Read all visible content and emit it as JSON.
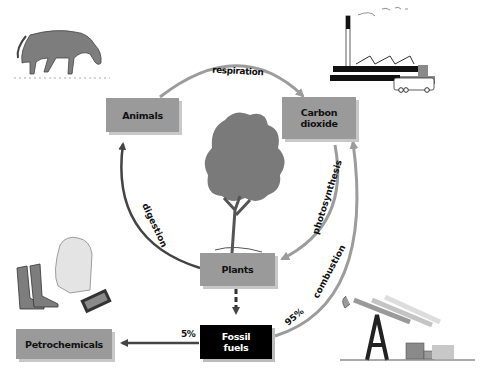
{
  "diagram": {
    "type": "carbon-cycle",
    "nodes": {
      "animals": "Animals",
      "carbon_dioxide_line1": "Carbon",
      "carbon_dioxide_line2": "dioxide",
      "plants": "Plants",
      "fossil_fuels_line1": "Fossil",
      "fossil_fuels_line2": "fuels",
      "petrochemicals": "Petrochemicals"
    },
    "edges": {
      "respiration": "respiration",
      "photosynthesis": "photosynthesis",
      "digestion": "digestion",
      "combustion": "combustion",
      "to_petrochemicals_pct": "5%",
      "to_combustion_pct": "95%"
    },
    "illustrations": [
      "horse",
      "factory-with-bus",
      "tree",
      "boots-shirt-money",
      "oil-pumpjacks"
    ],
    "colors": {
      "box_fill": "#9a9a9a",
      "box_shadow": "#c8c8c8",
      "fossil_box": "#000000",
      "arrow_dark": "#444444",
      "arrow_light": "#9c9c9c",
      "illustration_gray": "#7d7d7d"
    }
  }
}
